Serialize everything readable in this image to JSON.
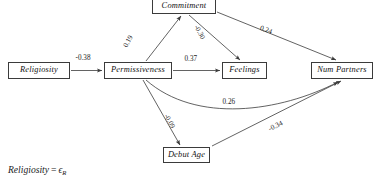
{
  "diagram": {
    "type": "path-diagram",
    "nodes": [
      {
        "id": "religiosity",
        "label": "Religiosity",
        "x": 8,
        "y": 62,
        "w": 62,
        "h": 17
      },
      {
        "id": "permissiveness",
        "label": "Permissiveness",
        "x": 104,
        "y": 62,
        "w": 68,
        "h": 17
      },
      {
        "id": "commitment",
        "label": "Commitment",
        "x": 152,
        "y": -1,
        "w": 64,
        "h": 15
      },
      {
        "id": "feelings",
        "label": "Feelings",
        "x": 222,
        "y": 62,
        "w": 45,
        "h": 17
      },
      {
        "id": "numpartners",
        "label": "Num Partners",
        "x": 311,
        "y": 62,
        "w": 62,
        "h": 17
      },
      {
        "id": "debutage",
        "label": "Debut Age",
        "x": 163,
        "y": 147,
        "w": 47,
        "h": 16
      }
    ],
    "edges": [
      {
        "id": "religiosity-to-permissiveness",
        "from": "religiosity",
        "to": "permissiveness",
        "value": "-0.38",
        "label_x": 75,
        "label_y": 62,
        "rotation": 0
      },
      {
        "id": "permissiveness-to-commitment",
        "from": "permissiveness",
        "to": "commitment",
        "value": "0.19",
        "label_x": 131,
        "label_y": 42,
        "rotation": -62
      },
      {
        "id": "commitment-to-feelings",
        "from": "commitment",
        "to": "feelings",
        "value": "-0.30",
        "label_x": 199,
        "label_y": 33,
        "rotation": 62
      },
      {
        "id": "commitment-to-numpartners",
        "from": "commitment",
        "to": "numpartners",
        "value": "0.24",
        "label_x": 268,
        "label_y": 32,
        "rotation": 20
      },
      {
        "id": "permissiveness-to-feelings",
        "from": "permissiveness",
        "to": "feelings",
        "value": "0.37",
        "label_x": 191,
        "label_y": 62,
        "rotation": 0
      },
      {
        "id": "permissiveness-to-numpartners",
        "from": "permissiveness",
        "to": "numpartners",
        "value": "0.26",
        "label_x": 231,
        "label_y": 103,
        "rotation": 0
      },
      {
        "id": "permissiveness-to-debutage",
        "from": "permissiveness",
        "to": "debutage",
        "value": "-0.09",
        "label_x": 170,
        "label_y": 122,
        "rotation": 62
      },
      {
        "id": "debutage-to-numpartners",
        "from": "debutage",
        "to": "numpartners",
        "value": "-0.34",
        "label_x": 277,
        "label_y": 127,
        "rotation": -20
      }
    ],
    "equation": {
      "lhs": "Religiosity",
      "operator": "=",
      "rhs_symbol": "ϵ",
      "rhs_subscript": "R"
    },
    "colors": {
      "stroke": "#3b3b3b",
      "text": "#111111",
      "background": "#ffffff"
    }
  }
}
